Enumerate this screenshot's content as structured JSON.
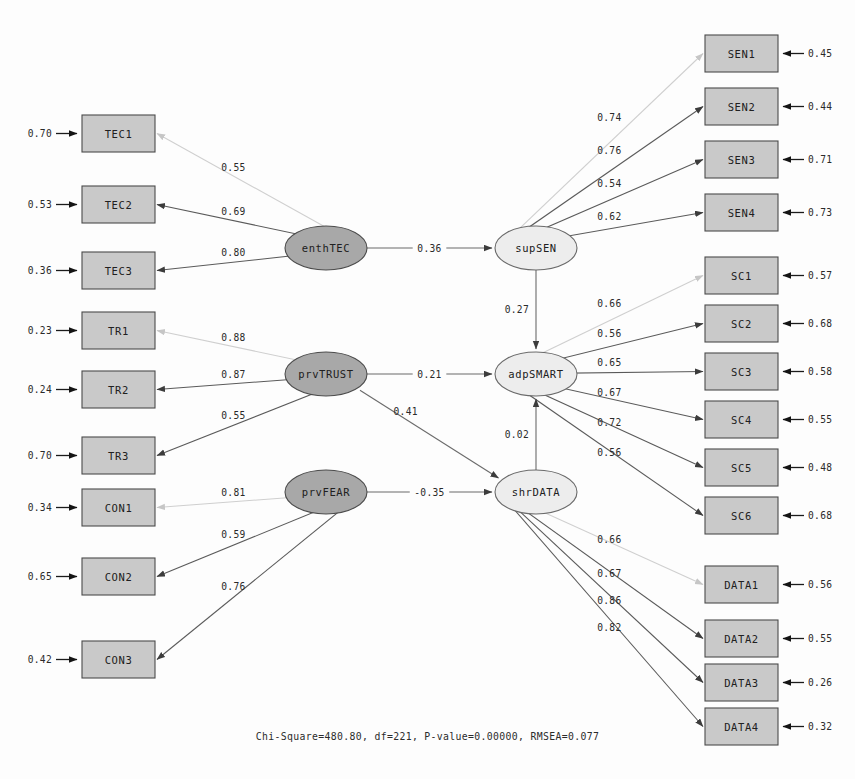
{
  "chart_data": {
    "type": "diagram",
    "fit_statistics": "Chi-Square=480.80, df=221, P-value=0.00000, RMSEA=0.077",
    "latent_variables": [
      {
        "id": "enthTEC",
        "label": "enthTEC",
        "kind": "exogenous",
        "x": 326,
        "y": 248
      },
      {
        "id": "prvTRUST",
        "label": "prvTRUST",
        "kind": "exogenous",
        "x": 326,
        "y": 374
      },
      {
        "id": "prvFEAR",
        "label": "prvFEAR",
        "kind": "exogenous",
        "x": 326,
        "y": 492
      },
      {
        "id": "supSEN",
        "label": "supSEN",
        "kind": "endogenous",
        "x": 536,
        "y": 248
      },
      {
        "id": "adpSMART",
        "label": "adpSMART",
        "kind": "endogenous",
        "x": 536,
        "y": 374
      },
      {
        "id": "shrDATA",
        "label": "shrDATA",
        "kind": "endogenous",
        "x": 536,
        "y": 492
      }
    ],
    "indicator_groups": [
      {
        "latent": "enthTEC",
        "side": "left",
        "indicators": [
          {
            "label": "TEC1",
            "loading": "0.55",
            "error": "0.70",
            "x": 82,
            "y": 115,
            "faint": true
          },
          {
            "label": "TEC2",
            "loading": "0.69",
            "error": "0.53",
            "x": 82,
            "y": 186,
            "faint": false
          },
          {
            "label": "TEC3",
            "loading": "0.80",
            "error": "0.36",
            "x": 82,
            "y": 252,
            "faint": false
          }
        ]
      },
      {
        "latent": "prvTRUST",
        "side": "left",
        "indicators": [
          {
            "label": "TR1",
            "loading": "0.88",
            "error": "0.23",
            "x": 82,
            "y": 312,
            "faint": true
          },
          {
            "label": "TR2",
            "loading": "0.87",
            "error": "0.24",
            "x": 82,
            "y": 371,
            "faint": false
          },
          {
            "label": "TR3",
            "loading": "0.55",
            "error": "0.70",
            "x": 82,
            "y": 437,
            "faint": false
          }
        ]
      },
      {
        "latent": "prvFEAR",
        "side": "left",
        "indicators": [
          {
            "label": "CON1",
            "loading": "0.81",
            "error": "0.34",
            "x": 82,
            "y": 489,
            "faint": true
          },
          {
            "label": "CON2",
            "loading": "0.59",
            "error": "0.65",
            "x": 82,
            "y": 558,
            "faint": false
          },
          {
            "label": "CON3",
            "loading": "0.76",
            "error": "0.42",
            "x": 82,
            "y": 641,
            "faint": false
          }
        ]
      },
      {
        "latent": "supSEN",
        "side": "right",
        "indicators": [
          {
            "label": "SEN1",
            "loading": "0.74",
            "error": "0.45",
            "x": 705,
            "y": 35,
            "faint": true
          },
          {
            "label": "SEN2",
            "loading": "0.76",
            "error": "0.44",
            "x": 705,
            "y": 88,
            "faint": false
          },
          {
            "label": "SEN3",
            "loading": "0.54",
            "error": "0.71",
            "x": 705,
            "y": 141,
            "faint": false
          },
          {
            "label": "SEN4",
            "loading": "0.62",
            "error": "0.73",
            "x": 705,
            "y": 194,
            "faint": false
          }
        ]
      },
      {
        "latent": "adpSMART",
        "side": "right",
        "indicators": [
          {
            "label": "SC1",
            "loading": "0.66",
            "error": "0.57",
            "x": 705,
            "y": 257,
            "faint": true
          },
          {
            "label": "SC2",
            "loading": "0.56",
            "error": "0.68",
            "x": 705,
            "y": 305,
            "faint": false
          },
          {
            "label": "SC3",
            "loading": "0.65",
            "error": "0.58",
            "x": 705,
            "y": 353,
            "faint": false
          },
          {
            "label": "SC4",
            "loading": "0.67",
            "error": "0.55",
            "x": 705,
            "y": 401,
            "faint": false
          },
          {
            "label": "SC5",
            "loading": "0.72",
            "error": "0.48",
            "x": 705,
            "y": 449,
            "faint": false
          },
          {
            "label": "SC6",
            "loading": "0.56",
            "error": "0.68",
            "x": 705,
            "y": 497,
            "faint": false
          }
        ]
      },
      {
        "latent": "shrDATA",
        "side": "right",
        "indicators": [
          {
            "label": "DATA1",
            "loading": "0.66",
            "error": "0.56",
            "x": 705,
            "y": 566,
            "faint": true
          },
          {
            "label": "DATA2",
            "loading": "0.67",
            "error": "0.55",
            "x": 705,
            "y": 620,
            "faint": false
          },
          {
            "label": "DATA3",
            "loading": "0.86",
            "error": "0.26",
            "x": 705,
            "y": 664,
            "faint": false
          },
          {
            "label": "DATA4",
            "loading": "0.82",
            "error": "0.32",
            "x": 705,
            "y": 708,
            "faint": false
          }
        ]
      }
    ],
    "structural_paths": [
      {
        "from": "enthTEC",
        "to": "supSEN",
        "coefficient": "0.36"
      },
      {
        "from": "prvTRUST",
        "to": "adpSMART",
        "coefficient": "0.21"
      },
      {
        "from": "prvTRUST",
        "to": "shrDATA",
        "coefficient": "0.41"
      },
      {
        "from": "prvFEAR",
        "to": "shrDATA",
        "coefficient": "-0.35"
      },
      {
        "from": "supSEN",
        "to": "adpSMART",
        "coefficient": "0.27"
      },
      {
        "from": "shrDATA",
        "to": "adpSMART",
        "coefficient": "0.02"
      }
    ],
    "colors": {
      "observed_fill": "#c9c9c9",
      "exogenous_latent_fill": "#a8a8a8",
      "endogenous_latent_fill": "#ededed",
      "stroke": "#4b4b4b",
      "background": "#fdfdfd"
    }
  },
  "footer": {
    "fit_text": "Chi-Square=480.80, df=221, P-value=0.00000, RMSEA=0.077"
  }
}
